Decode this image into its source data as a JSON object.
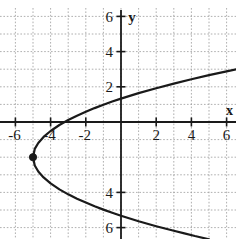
{
  "caption": {
    "text": "( x , y )",
    "visible": false
  },
  "chart_data": {
    "type": "line",
    "title": "",
    "subtitle": "",
    "xlabel": "x",
    "ylabel": "y",
    "xlim": [
      -6.6,
      6.6
    ],
    "ylim": [
      -6.6,
      6.6
    ],
    "grid": true,
    "grid_style": "dotted",
    "grid_step": 1,
    "legend": "none",
    "axis_color": "#1a1a1a",
    "curve_color": "#1a1a1a",
    "grid_color": "#9a9a9a",
    "background": "#ffffff",
    "x_ticks": [
      -6,
      -4,
      -2,
      2,
      4,
      6
    ],
    "x_tick_labels": [
      "-6",
      "-4",
      "-2",
      "2",
      "4",
      "6"
    ],
    "y_ticks": [
      6,
      4,
      2,
      -4,
      -6
    ],
    "y_tick_labels": [
      "6",
      "4",
      "2",
      "4",
      "6"
    ],
    "relation": "x = 0.45(y + 2)^2 - 5",
    "vertex": {
      "x": -5,
      "y": -2,
      "marked": true,
      "marker": "filled-circle"
    },
    "opens": "right",
    "series": [
      {
        "name": "upper-branch",
        "points": [
          [
            -5.0,
            -2.0
          ],
          [
            -4.9,
            -1.53
          ],
          [
            -4.7,
            -1.19
          ],
          [
            -4.4,
            -0.85
          ],
          [
            -4.0,
            -0.51
          ],
          [
            -3.5,
            -0.17
          ],
          [
            -3.0,
            0.11
          ],
          [
            -2.5,
            0.36
          ],
          [
            -2.0,
            0.58
          ],
          [
            -1.5,
            0.79
          ],
          [
            -1.0,
            0.98
          ],
          [
            -0.5,
            1.16
          ],
          [
            0.0,
            1.33
          ],
          [
            1.0,
            1.64
          ],
          [
            2.0,
            1.92
          ],
          [
            3.0,
            2.18
          ],
          [
            4.0,
            2.43
          ],
          [
            5.0,
            2.66
          ],
          [
            6.0,
            2.88
          ],
          [
            6.6,
            3.0
          ]
        ]
      },
      {
        "name": "lower-branch",
        "points": [
          [
            -5.0,
            -2.0
          ],
          [
            -4.9,
            -2.47
          ],
          [
            -4.7,
            -2.81
          ],
          [
            -4.4,
            -3.15
          ],
          [
            -4.0,
            -3.49
          ],
          [
            -3.5,
            -3.83
          ],
          [
            -3.0,
            -4.11
          ],
          [
            -2.5,
            -4.36
          ],
          [
            -2.0,
            -4.58
          ],
          [
            -1.5,
            -4.79
          ],
          [
            -1.0,
            -4.98
          ],
          [
            -0.5,
            -5.16
          ],
          [
            0.0,
            -5.33
          ],
          [
            1.0,
            -5.64
          ],
          [
            2.0,
            -5.92
          ],
          [
            3.0,
            -6.18
          ],
          [
            3.6,
            -6.33
          ],
          [
            4.2,
            -6.48
          ],
          [
            5.0,
            -6.66
          ]
        ]
      }
    ]
  },
  "axes": {
    "x_axis_label": "x",
    "y_axis_label": "y"
  }
}
